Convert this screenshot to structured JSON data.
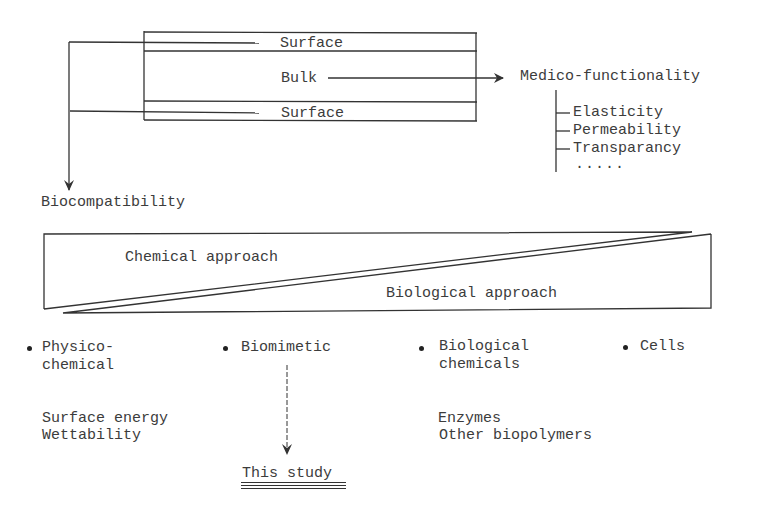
{
  "diagram": {
    "layers": {
      "surface_top": "Surface",
      "bulk": "Bulk",
      "surface_bottom": "Surface"
    },
    "targets": {
      "medico_functionality": "Medico-functionality",
      "biocompatibility": "Biocompatibility"
    },
    "properties": [
      "Elasticity",
      "Permeability",
      "Transparancy",
      "....."
    ],
    "approaches": {
      "chemical": "Chemical approach",
      "biological": "Biological approach"
    },
    "categories": [
      {
        "line1": "Physico-",
        "line2": "chemical",
        "examples": [
          "Surface energy",
          "Wettability"
        ]
      },
      {
        "line1": "Biomimetic",
        "line2": "",
        "examples": []
      },
      {
        "line1": "Biological",
        "line2": "chemicals",
        "examples": [
          "Enzymes",
          "Other biopolymers"
        ]
      },
      {
        "line1": "Cells",
        "line2": "",
        "examples": []
      }
    ],
    "conclusion": "This study"
  }
}
